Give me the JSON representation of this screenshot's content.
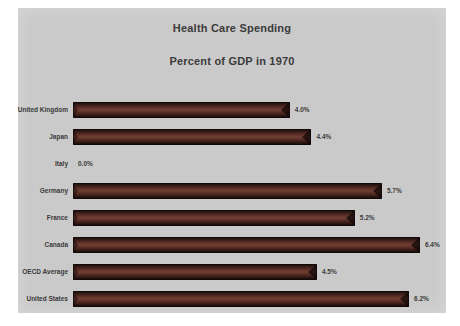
{
  "chart_data": {
    "type": "bar",
    "orientation": "horizontal",
    "title": "Health Care Spending",
    "subtitle": "Percent of GDP in 1970",
    "categories": [
      "United Kingdom",
      "Japan",
      "Italy",
      "Germany",
      "France",
      "Canada",
      "OECD Average",
      "United States"
    ],
    "values": [
      4.0,
      4.4,
      0.0,
      5.7,
      5.2,
      6.4,
      4.5,
      6.2
    ],
    "value_labels": [
      "4.0%",
      "4.4%",
      "0.0%",
      "5.7%",
      "5.2%",
      "6.4%",
      "4.5%",
      "6.2%"
    ],
    "unit": "percent of GDP",
    "xlim": [
      0,
      6.6
    ],
    "grid": "off",
    "legend": "none",
    "bar_color": "#5e2f26",
    "background_color": "#cacaca",
    "text_color": "#3b3b3b"
  }
}
